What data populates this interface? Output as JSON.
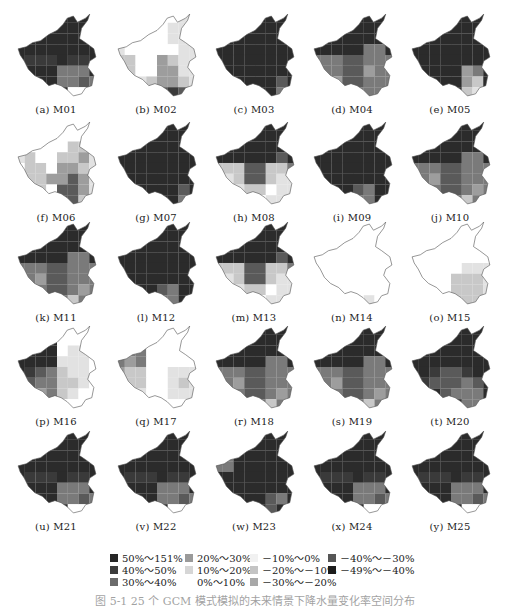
{
  "figure": {
    "panels": [
      {
        "label": "(a) M01",
        "pattern": "dark_se_mid"
      },
      {
        "label": "(b) M02",
        "pattern": "light_se_dark"
      },
      {
        "label": "(c) M03",
        "pattern": "all_dark"
      },
      {
        "label": "(d) M04",
        "pattern": "dark_south_mid"
      },
      {
        "label": "(e) M05",
        "pattern": "dark_se_light"
      },
      {
        "label": "(f) M06",
        "pattern": "light_mixed"
      },
      {
        "label": "(g) M07",
        "pattern": "all_dark"
      },
      {
        "label": "(h) M08",
        "pattern": "dark_north_light_south"
      },
      {
        "label": "(i) M09",
        "pattern": "all_dark_se_mid"
      },
      {
        "label": "(j) M10",
        "pattern": "dark_north_mid_south"
      },
      {
        "label": "(k) M11",
        "pattern": "dark_north_mid_south"
      },
      {
        "label": "(l) M12",
        "pattern": "all_dark_se_mid"
      },
      {
        "label": "(m) M13",
        "pattern": "dark_north_light_south"
      },
      {
        "label": "(n) M14",
        "pattern": "very_light"
      },
      {
        "label": "(o) M15",
        "pattern": "very_light_se"
      },
      {
        "label": "(p) M16",
        "pattern": "west_dark_east_light"
      },
      {
        "label": "(q) M17",
        "pattern": "light_west_mid"
      },
      {
        "label": "(r) M18",
        "pattern": "dark_north_mid_south"
      },
      {
        "label": "(s) M19",
        "pattern": "dark_north_mid_south"
      },
      {
        "label": "(t) M20",
        "pattern": "dark_sw_black"
      },
      {
        "label": "(u) M21",
        "pattern": "dark_se_mid"
      },
      {
        "label": "(v) M22",
        "pattern": "dark_se_mid"
      },
      {
        "label": "(w) M23",
        "pattern": "dark_west_mid"
      },
      {
        "label": "(x) M24",
        "pattern": "dark_se_mid"
      },
      {
        "label": "(y) M25",
        "pattern": "dark_se_mid"
      }
    ],
    "legend": [
      {
        "label": "50%～151%",
        "color": "#262626"
      },
      {
        "label": "40%～50%",
        "color": "#3c3c3c"
      },
      {
        "label": "30%～40%",
        "color": "#6b6b6b"
      },
      {
        "label": "20%～30%",
        "color": "#9a9a9a"
      },
      {
        "label": "10%～20%",
        "color": "#d6d6d6"
      },
      {
        "label": "0%～10%",
        "color": "#ffffff"
      },
      {
        "label": "－10%～0%",
        "color": "#f1f1f1"
      },
      {
        "label": "－20%～－10%",
        "color": "#c4c4c4"
      },
      {
        "label": "－30%～－20%",
        "color": "#a8a8a8"
      },
      {
        "label": "－40%～－30%",
        "color": "#565656"
      },
      {
        "label": "－49%～－40%",
        "color": "#1c1c1c"
      }
    ],
    "caption": "图 5-1  25 个 GCM 模式模拟的未来情景下降水量变化率空间分布"
  }
}
